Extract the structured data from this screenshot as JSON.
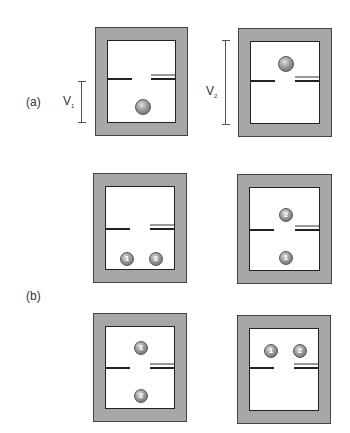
{
  "panels": {
    "a": {
      "label": "(a)",
      "left": {
        "volume_label": "V",
        "volume_sub": "1",
        "ball_position": "lower"
      },
      "right": {
        "volume_label": "V",
        "volume_sub": "2",
        "ball_position": "upper"
      }
    },
    "b": {
      "label": "(b)",
      "boxes": [
        {
          "balls": [
            {
              "n": "1",
              "pos": "lower-left"
            },
            {
              "n": "2",
              "pos": "lower-right"
            }
          ]
        },
        {
          "balls": [
            {
              "n": "2",
              "pos": "upper"
            },
            {
              "n": "1",
              "pos": "lower"
            }
          ]
        },
        {
          "balls": [
            {
              "n": "1",
              "pos": "upper"
            },
            {
              "n": "2",
              "pos": "lower"
            }
          ]
        },
        {
          "balls": [
            {
              "n": "1",
              "pos": "upper-left"
            },
            {
              "n": "2",
              "pos": "upper-right"
            }
          ]
        }
      ]
    }
  },
  "colors": {
    "frame": "#a7a7a7",
    "outline": "#222222",
    "ball": "#8a8a8a"
  }
}
